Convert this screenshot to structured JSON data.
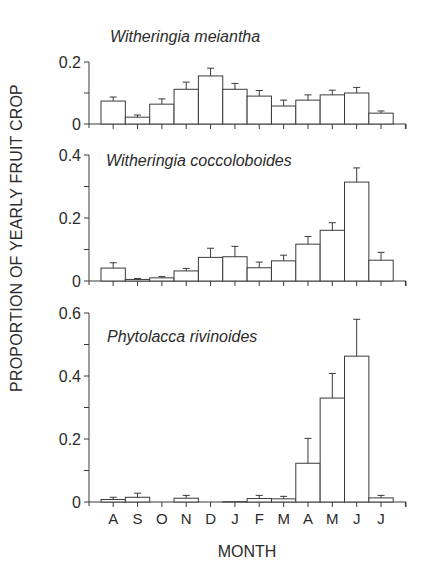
{
  "figure": {
    "ylabel": "PROPORTION OF YEARLY FRUIT CROP",
    "xlabel": "MONTH",
    "months": [
      "A",
      "S",
      "O",
      "N",
      "D",
      "J",
      "F",
      "M",
      "A",
      "M",
      "J",
      "J"
    ]
  },
  "chart_data": [
    {
      "type": "bar",
      "title": "Witheringia meiantha",
      "categories": [
        "A",
        "S",
        "O",
        "N",
        "D",
        "J",
        "F",
        "M",
        "A",
        "M",
        "J",
        "J"
      ],
      "values": [
        0.074,
        0.022,
        0.064,
        0.112,
        0.155,
        0.112,
        0.09,
        0.058,
        0.077,
        0.094,
        0.1,
        0.035
      ],
      "error_upper": [
        0.087,
        0.029,
        0.081,
        0.135,
        0.18,
        0.131,
        0.108,
        0.077,
        0.094,
        0.109,
        0.118,
        0.042
      ],
      "xlabel": "MONTH",
      "ylabel": "PROPORTION OF YEARLY FRUIT CROP",
      "ylim": [
        0,
        0.2
      ],
      "yticks": [
        0,
        0.2
      ],
      "ytick_labels": [
        "0",
        "0.2"
      ],
      "grid": false,
      "legend": null
    },
    {
      "type": "bar",
      "title": "Witheringia coccoloboides",
      "categories": [
        "A",
        "S",
        "O",
        "N",
        "D",
        "J",
        "F",
        "M",
        "A",
        "M",
        "J",
        "J"
      ],
      "values": [
        0.041,
        0.005,
        0.01,
        0.032,
        0.075,
        0.077,
        0.042,
        0.064,
        0.117,
        0.161,
        0.314,
        0.066
      ],
      "error_upper": [
        0.058,
        0.008,
        0.014,
        0.04,
        0.104,
        0.11,
        0.06,
        0.082,
        0.141,
        0.185,
        0.359,
        0.091
      ],
      "xlabel": "MONTH",
      "ylabel": "PROPORTION OF YEARLY FRUIT CROP",
      "ylim": [
        0,
        0.4
      ],
      "yticks": [
        0,
        0.2,
        0.4
      ],
      "ytick_labels": [
        "0",
        "0.2",
        "0.4"
      ],
      "grid": false,
      "legend": null
    },
    {
      "type": "bar",
      "title": "Phytolacca rivinoides",
      "categories": [
        "A",
        "S",
        "O",
        "N",
        "D",
        "J",
        "F",
        "M",
        "A",
        "M",
        "J",
        "J"
      ],
      "values": [
        0.008,
        0.015,
        0,
        0.012,
        0,
        0.001,
        0.011,
        0.01,
        0.123,
        0.33,
        0.463,
        0.013
      ],
      "error_upper": [
        0.015,
        0.028,
        0,
        0.021,
        0,
        0.001,
        0.021,
        0.018,
        0.202,
        0.408,
        0.58,
        0.021
      ],
      "xlabel": "MONTH",
      "ylabel": "PROPORTION OF YEARLY FRUIT CROP",
      "ylim": [
        0,
        0.6
      ],
      "yticks": [
        0,
        0.2,
        0.4,
        0.6
      ],
      "ytick_labels": [
        "0",
        "0.2",
        "0.4",
        "0.6"
      ],
      "grid": false,
      "legend": null
    }
  ]
}
